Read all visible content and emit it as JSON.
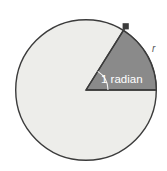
{
  "figure": {
    "name": "one-radian-circle-diagram",
    "title": "Circle with a one radian sector",
    "background_color": "#ffffff"
  },
  "circle": {
    "center_x": 86,
    "center_y": 90,
    "radius": 71,
    "fill_color": "#ededea",
    "stroke_color": "#3b3b3b",
    "stroke_width": 1.4
  },
  "sector": {
    "label": "1 radian",
    "angle_value": 1,
    "angle_unit": "radian",
    "start_angle_deg": 0,
    "end_angle_deg": 58,
    "fill_color": "#8a8a8a",
    "stroke_color": "#3b3b3b",
    "stroke_width": 1.4
  },
  "angle_arc": {
    "name": "angle-arc-marker",
    "radius": 22,
    "stroke_color": "#f2f2f2",
    "stroke_width": 1.1
  },
  "arc_endpoint_marker": {
    "name": "arc-endpoint-dot",
    "x": 126,
    "y": 26,
    "size": 6,
    "color": "#3b3b3b"
  },
  "labels": {
    "radian": {
      "text": "1 radian",
      "x": 101,
      "y": 83,
      "font_size": 11.5,
      "color": "#ffffff"
    },
    "radius": {
      "text": "r",
      "x": 152,
      "y": 52,
      "font_size": 10,
      "color": "#555555"
    }
  }
}
